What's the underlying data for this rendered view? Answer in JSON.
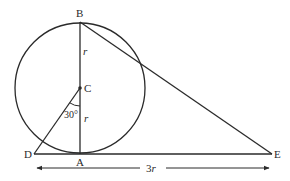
{
  "diagram": {
    "points": {
      "B": "B",
      "C": "C",
      "A": "A",
      "D": "D",
      "E": "E"
    },
    "segment_labels": {
      "BC": "r",
      "CA": "r"
    },
    "angle_label": "30°",
    "dimension_label": "3r",
    "colors": {
      "ink": "#2a2a2a",
      "background": "#ffffff"
    }
  }
}
